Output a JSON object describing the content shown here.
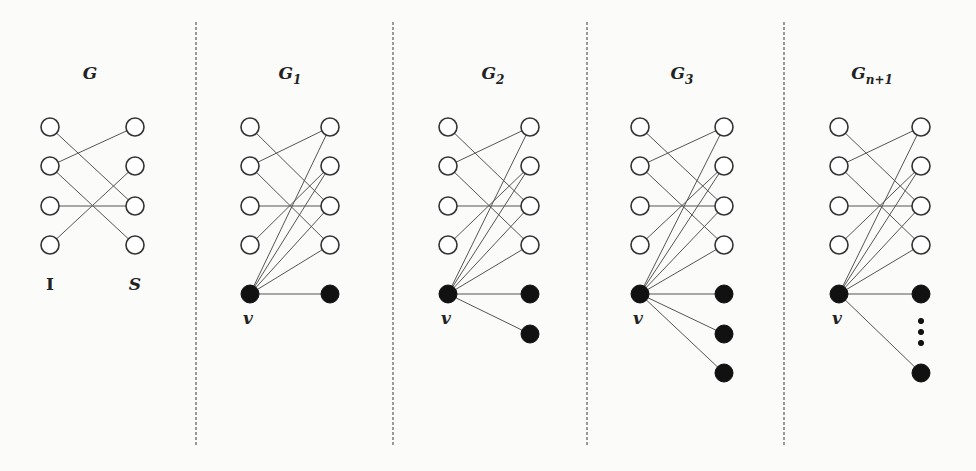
{
  "figure": {
    "dividers": [
      196,
      393,
      587,
      784
    ],
    "divider_range": [
      22,
      445
    ],
    "rows_y": [
      127,
      166,
      206,
      245
    ],
    "v_y": 294,
    "node_radius": 9,
    "panels": [
      {
        "id": "G",
        "title": "G",
        "subscript": "",
        "left_x": 50,
        "right_x": 135,
        "title_x": 90,
        "bottom_labels": {
          "left": "I",
          "right": "S",
          "y": 290
        },
        "has_v": false,
        "extra_right_y": [],
        "dots": false
      },
      {
        "id": "G1",
        "title": "G",
        "subscript": "1",
        "left_x": 250,
        "right_x": 330,
        "title_x": 290,
        "has_v": true,
        "v_label": "v",
        "extra_right_y": [
          294
        ],
        "dots": false
      },
      {
        "id": "G2",
        "title": "G",
        "subscript": "2",
        "left_x": 448,
        "right_x": 530,
        "title_x": 493,
        "has_v": true,
        "v_label": "v",
        "extra_right_y": [
          294,
          334
        ],
        "dots": false
      },
      {
        "id": "G3",
        "title": "G",
        "subscript": "3",
        "left_x": 640,
        "right_x": 724,
        "title_x": 682,
        "has_v": true,
        "v_label": "v",
        "extra_right_y": [
          294,
          334,
          373
        ],
        "dots": false
      },
      {
        "id": "Gn+1",
        "title": "G",
        "subscript": "n+1",
        "left_x": 839,
        "right_x": 921,
        "title_x": 872,
        "has_v": true,
        "v_label": "v",
        "extra_right_y": [
          294,
          373
        ],
        "dots": true,
        "dots_y": [
          321,
          332,
          343
        ]
      }
    ],
    "base_edges": [
      [
        0,
        2
      ],
      [
        1,
        0
      ],
      [
        1,
        3
      ],
      [
        2,
        2
      ],
      [
        3,
        1
      ]
    ],
    "v_edges_to_S": [
      0,
      1,
      2,
      3
    ],
    "title_y": 79
  }
}
